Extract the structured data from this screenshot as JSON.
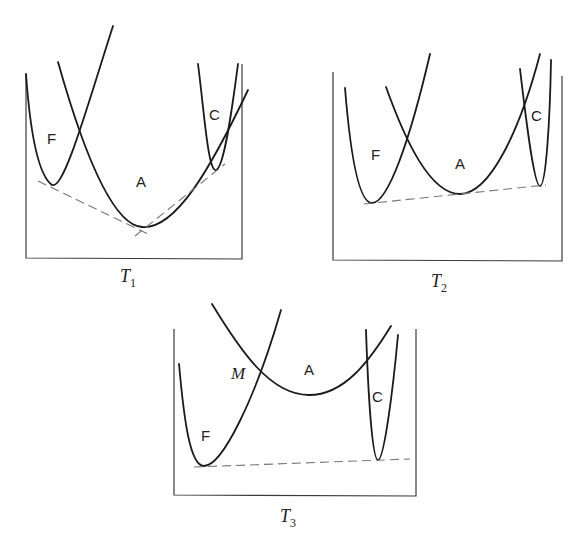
{
  "figure": {
    "panels": [
      {
        "id": "T1",
        "label": {
          "main": "T",
          "sub": "1"
        },
        "phases": [
          {
            "name": "F"
          },
          {
            "name": "A"
          },
          {
            "name": "C"
          }
        ],
        "common_tangents": 2
      },
      {
        "id": "T2",
        "label": {
          "main": "T",
          "sub": "2"
        },
        "phases": [
          {
            "name": "F"
          },
          {
            "name": "A"
          },
          {
            "name": "C"
          }
        ],
        "common_tangents": 1
      },
      {
        "id": "T3",
        "label": {
          "main": "T",
          "sub": "3"
        },
        "phases": [
          {
            "name": "F"
          },
          {
            "name": "A"
          },
          {
            "name": "C"
          }
        ],
        "intersection_label": "M",
        "common_tangents": 1
      }
    ]
  },
  "colors": {
    "curve": "#1a1a1a",
    "tangent": "#777777",
    "axis": "#3a3a3a",
    "background": "#ffffff"
  }
}
